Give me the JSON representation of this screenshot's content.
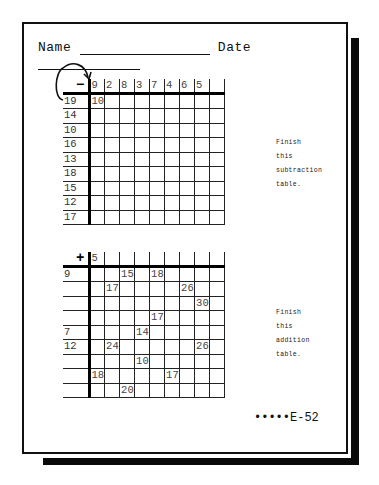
{
  "worksheet": {
    "name_label": "Name",
    "date_label": "Date",
    "footer": "•••••E-52"
  },
  "subtraction": {
    "operator": "−",
    "column_headers": [
      "9",
      "2",
      "8",
      "3",
      "7",
      "4",
      "6",
      "5",
      ""
    ],
    "row_headers": [
      "19",
      "14",
      "10",
      "16",
      "13",
      "18",
      "15",
      "12",
      "17"
    ],
    "cells": [
      [
        "10",
        "",
        "",
        "",
        "",
        "",
        "",
        "",
        ""
      ],
      [
        "",
        "",
        "",
        "",
        "",
        "",
        "",
        "",
        ""
      ],
      [
        "",
        "",
        "",
        "",
        "",
        "",
        "",
        "",
        ""
      ],
      [
        "",
        "",
        "",
        "",
        "",
        "",
        "",
        "",
        ""
      ],
      [
        "",
        "",
        "",
        "",
        "",
        "",
        "",
        "",
        ""
      ],
      [
        "",
        "",
        "",
        "",
        "",
        "",
        "",
        "",
        ""
      ],
      [
        "",
        "",
        "",
        "",
        "",
        "",
        "",
        "",
        ""
      ],
      [
        "",
        "",
        "",
        "",
        "",
        "",
        "",
        "",
        ""
      ],
      [
        "",
        "",
        "",
        "",
        "",
        "",
        "",
        "",
        ""
      ]
    ],
    "instructions": [
      "Finish",
      "this",
      "subtraction",
      "table."
    ]
  },
  "addition": {
    "operator": "+",
    "column_headers": [
      "5",
      "",
      "",
      "",
      "",
      "",
      "",
      "",
      ""
    ],
    "row_headers": [
      "9",
      "",
      "",
      "",
      "7",
      "12",
      "",
      "",
      ""
    ],
    "cells": [
      [
        "",
        "",
        "15",
        "",
        "18",
        "",
        "",
        "",
        ""
      ],
      [
        "",
        "17",
        "",
        "",
        "",
        "",
        "26",
        "",
        ""
      ],
      [
        "",
        "",
        "",
        "",
        "",
        "",
        "",
        "30",
        ""
      ],
      [
        "",
        "",
        "",
        "",
        "17",
        "",
        "",
        "",
        ""
      ],
      [
        "",
        "",
        "",
        "14",
        "",
        "",
        "",
        "",
        ""
      ],
      [
        "",
        "24",
        "",
        "",
        "",
        "",
        "",
        "26",
        ""
      ],
      [
        "",
        "",
        "",
        "10",
        "",
        "",
        "",
        "",
        ""
      ],
      [
        "18",
        "",
        "",
        "",
        "",
        "17",
        "",
        "",
        ""
      ],
      [
        "",
        "",
        "20",
        "",
        "",
        "",
        "",
        "",
        ""
      ]
    ],
    "instructions": [
      "Finish",
      "this",
      "addition",
      "table."
    ]
  }
}
